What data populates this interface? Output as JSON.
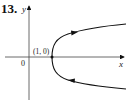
{
  "problem_number": "13.",
  "axes": {
    "x_label": "x",
    "y_label": "y",
    "origin_label": "0"
  },
  "point": {
    "label": "(1, 0)",
    "x": 1,
    "y": 0
  },
  "curve": {
    "description": "parametric curve opening to the right, vertex at (1,0)",
    "direction": "from lower branch toward vertex then up along upper branch",
    "arrows": [
      "lower branch pointing left",
      "upper branch pointing right"
    ]
  },
  "colors": {
    "stroke": "#111111",
    "background": "#ffffff"
  }
}
